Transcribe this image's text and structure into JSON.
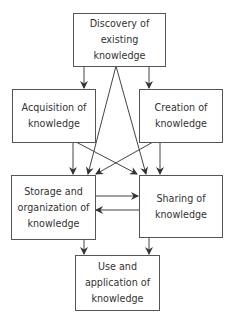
{
  "colors": {
    "line": "#444444",
    "border": "#555555",
    "text": "#333333",
    "background": "#ffffff"
  },
  "nodes": {
    "discovery": {
      "lines": [
        "Discovery of",
        "existing",
        "knowledge"
      ]
    },
    "acquisition": {
      "lines": [
        "Acquisition of",
        "knowledge"
      ]
    },
    "creation": {
      "lines": [
        "Creation of",
        "knowledge"
      ]
    },
    "storage": {
      "lines": [
        "Storage and",
        "organization of",
        "knowledge"
      ]
    },
    "sharing": {
      "lines": [
        "Sharing of",
        "knowledge"
      ]
    },
    "use": {
      "lines": [
        "Use and",
        "application of",
        "knowledge"
      ]
    }
  },
  "edges": [
    {
      "from": "discovery",
      "to": "acquisition"
    },
    {
      "from": "discovery",
      "to": "creation"
    },
    {
      "from": "discovery",
      "to": "storage"
    },
    {
      "from": "discovery",
      "to": "sharing"
    },
    {
      "from": "acquisition",
      "to": "storage"
    },
    {
      "from": "acquisition",
      "to": "sharing"
    },
    {
      "from": "creation",
      "to": "sharing"
    },
    {
      "from": "creation",
      "to": "storage"
    },
    {
      "from": "storage",
      "to": "sharing"
    },
    {
      "from": "sharing",
      "to": "storage"
    },
    {
      "from": "storage",
      "to": "use"
    },
    {
      "from": "sharing",
      "to": "use"
    }
  ]
}
